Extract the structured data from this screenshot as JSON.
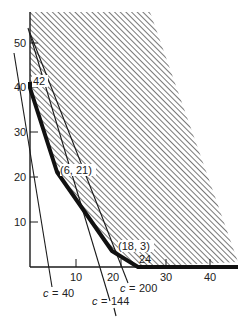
{
  "figure": {
    "type": "linear-programming-feasible-region",
    "y_axis_ticks": [
      {
        "value": 10,
        "label": "10"
      },
      {
        "value": 20,
        "label": "20"
      },
      {
        "value": 30,
        "label": "30"
      },
      {
        "value": 40,
        "label": "40"
      },
      {
        "value": 50,
        "label": "50"
      }
    ],
    "x_axis_ticks": [
      {
        "value": 10,
        "label": "10"
      },
      {
        "value": 20,
        "label": "20"
      },
      {
        "value": 30,
        "label": "30"
      },
      {
        "value": 40,
        "label": "40"
      }
    ],
    "vertices": [
      {
        "x": 0,
        "y": 42,
        "label": "42"
      },
      {
        "x": 6,
        "y": 21,
        "label": "(6, 21)"
      },
      {
        "x": 18,
        "y": 3,
        "label": "(18, 3)"
      },
      {
        "x": 24,
        "y": 0,
        "label": "24"
      }
    ],
    "cost_lines": [
      {
        "label": "c = 40",
        "c_symbol": "c",
        "value": "40"
      },
      {
        "label": "c = 144",
        "c_symbol": "c",
        "value": "144"
      },
      {
        "label": "c = 200",
        "c_symbol": "c",
        "value": "200"
      }
    ],
    "colors": {
      "ink": "#1a1a1a",
      "hatch": "#555555",
      "background": "#ffffff"
    }
  }
}
